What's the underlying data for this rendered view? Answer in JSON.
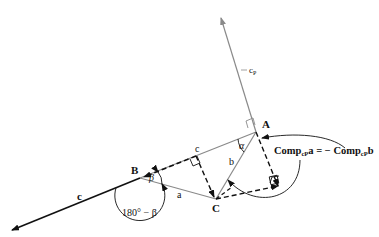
{
  "diagram": {
    "type": "vector-geometry",
    "points": {
      "A": {
        "label": "A"
      },
      "B": {
        "label": "B"
      },
      "C": {
        "label": "C"
      }
    },
    "vectors": {
      "a": {
        "label": "a"
      },
      "b": {
        "label": "b"
      },
      "c_side": {
        "label": "c"
      },
      "c_extended": {
        "label": "c"
      },
      "cP": {
        "label": "c",
        "subscript": "P"
      }
    },
    "angles": {
      "alpha": {
        "label": "α"
      },
      "beta": {
        "label": "β"
      },
      "exterior": {
        "label": "180° − β"
      }
    },
    "equation": {
      "lhs_prefix": "Comp",
      "lhs_sub": "cP",
      "lhs_suffix": "a = − ",
      "rhs_prefix": "Comp",
      "rhs_sub": "cP",
      "rhs_suffix": "b"
    },
    "colors": {
      "dark": "#111111",
      "gray": "#8a8a8a"
    }
  }
}
